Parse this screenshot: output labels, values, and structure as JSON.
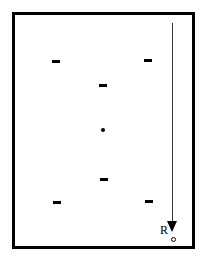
{
  "diagram": {
    "type": "charge-distribution",
    "frame": {
      "color": "#000000"
    },
    "charges": [
      {
        "sign": "-",
        "label": "negative-charge",
        "x": 56,
        "y": 61
      },
      {
        "sign": "-",
        "label": "negative-charge",
        "x": 148,
        "y": 60
      },
      {
        "sign": "-",
        "label": "negative-charge",
        "x": 103,
        "y": 85
      },
      {
        "sign": "-",
        "label": "negative-charge",
        "x": 103,
        "y": 179
      },
      {
        "sign": "-",
        "label": "negative-charge",
        "x": 57,
        "y": 202
      },
      {
        "sign": "-",
        "label": "negative-charge",
        "x": 149,
        "y": 201
      }
    ],
    "center_point": {
      "x": 103,
      "y": 130
    },
    "arrow": {
      "x": 172,
      "y_start": 23,
      "y_end": 232,
      "direction": "down"
    },
    "point_R": {
      "label": "R",
      "x": 174,
      "y": 240
    }
  }
}
